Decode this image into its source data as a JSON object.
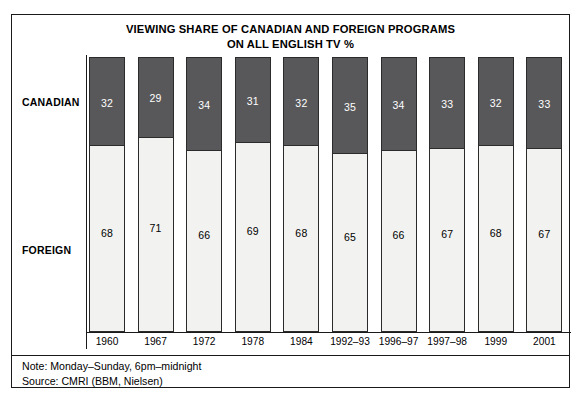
{
  "chart_data": {
    "type": "bar",
    "title": "VIEWING SHARE OF CANADIAN AND FOREIGN PROGRAMS ON ALL ENGLISH TV %",
    "title_lines": [
      "VIEWING SHARE OF CANADIAN AND FOREIGN PROGRAMS",
      "ON ALL ENGLISH TV %"
    ],
    "stacked": true,
    "orientation": "vertical",
    "xlabel": "",
    "ylabel": "",
    "ylim": [
      0,
      100
    ],
    "grid": false,
    "legend_position": "left-axis-labels",
    "categories": [
      "1960",
      "1967",
      "1972",
      "1978",
      "1984",
      "1992–93",
      "1996–97",
      "1997–98",
      "1999",
      "2001"
    ],
    "series": [
      {
        "name": "CANADIAN",
        "color": "#58585a",
        "text_color": "#ffffff",
        "values": [
          32,
          29,
          34,
          31,
          32,
          35,
          34,
          33,
          32,
          33
        ]
      },
      {
        "name": "FOREIGN",
        "color": "#f2f2f0",
        "text_color": "#000000",
        "values": [
          68,
          71,
          66,
          69,
          68,
          65,
          66,
          67,
          68,
          67
        ]
      }
    ],
    "annotations": [
      "Note: Monday–Sunday, 6pm–midnight",
      "Source: CMRI (BBM, Nielsen)"
    ]
  },
  "footer": {
    "note": "Note: Monday–Sunday, 6pm–midnight",
    "source": "Source: CMRI (BBM, Nielsen)"
  },
  "colors": {
    "canadian_fill": "#58585a",
    "foreign_fill": "#f2f2f0",
    "stroke": "#2b2b2b",
    "frame": "#1a1a1a",
    "background": "#ffffff"
  }
}
